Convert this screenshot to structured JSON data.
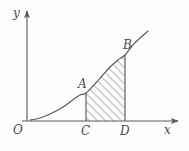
{
  "figure": {
    "kind": "cartesian-diagram",
    "width": 189,
    "height": 151,
    "background_color": "#fdfdfd",
    "stroke_color": "#5a5a5a",
    "hatch_color": "#777777",
    "label_color": "#4a4a4a"
  },
  "axes": {
    "x_axis_label": "x",
    "y_axis_label": "y",
    "origin_label": "O",
    "x_axis_y_px": 121,
    "y_axis_x_px": 27,
    "x_axis_start_px": 22,
    "x_axis_end_px": 178,
    "y_axis_top_px": 11,
    "arrowheads": [
      "x-axis-right",
      "y-axis-top"
    ]
  },
  "labels": [
    {
      "name": "A",
      "text": "A",
      "x_px": 86,
      "y_px": 93
    },
    {
      "name": "B",
      "text": "B",
      "x_px": 125,
      "y_px": 55
    },
    {
      "name": "C",
      "text": "C",
      "x_px": 86,
      "y_px": 121
    },
    {
      "name": "D",
      "text": "D",
      "x_px": 125,
      "y_px": 121
    }
  ],
  "chart_data": {
    "type": "line",
    "title": "",
    "xlabel": "x",
    "ylabel": "y",
    "grid": false,
    "legend": null,
    "annotations": [
      "O",
      "A",
      "B",
      "C",
      "D",
      "x",
      "y"
    ],
    "series": [
      {
        "name": "curve",
        "description": "increasing convex curve through A and B",
        "points_px": [
          [
            30,
            120
          ],
          [
            36,
            119
          ],
          [
            43,
            117
          ],
          [
            50,
            114
          ],
          [
            58,
            110
          ],
          [
            66,
            105
          ],
          [
            74,
            99
          ],
          [
            80,
            95
          ],
          [
            86,
            93
          ],
          [
            94,
            85
          ],
          [
            102,
            76
          ],
          [
            110,
            67
          ],
          [
            118,
            60
          ],
          [
            125,
            55
          ],
          [
            132,
            46
          ],
          [
            140,
            38
          ],
          [
            148,
            31
          ]
        ]
      }
    ],
    "shaded_region": {
      "name": "region-ACDB",
      "description": "area under the curve between vertical lines at C and D, above the x-axis",
      "hatch_angle_deg": 45,
      "hatch_spacing_px": 4,
      "left_boundary_x_px": 86,
      "right_boundary_x_px": 125,
      "bottom_boundary_y_px": 121
    },
    "vertical_segments": [
      {
        "name": "segment-AC",
        "x_px": 86,
        "y_top_px": 93,
        "y_bottom_px": 121
      },
      {
        "name": "segment-BD",
        "x_px": 125,
        "y_top_px": 55,
        "y_bottom_px": 121
      }
    ]
  }
}
